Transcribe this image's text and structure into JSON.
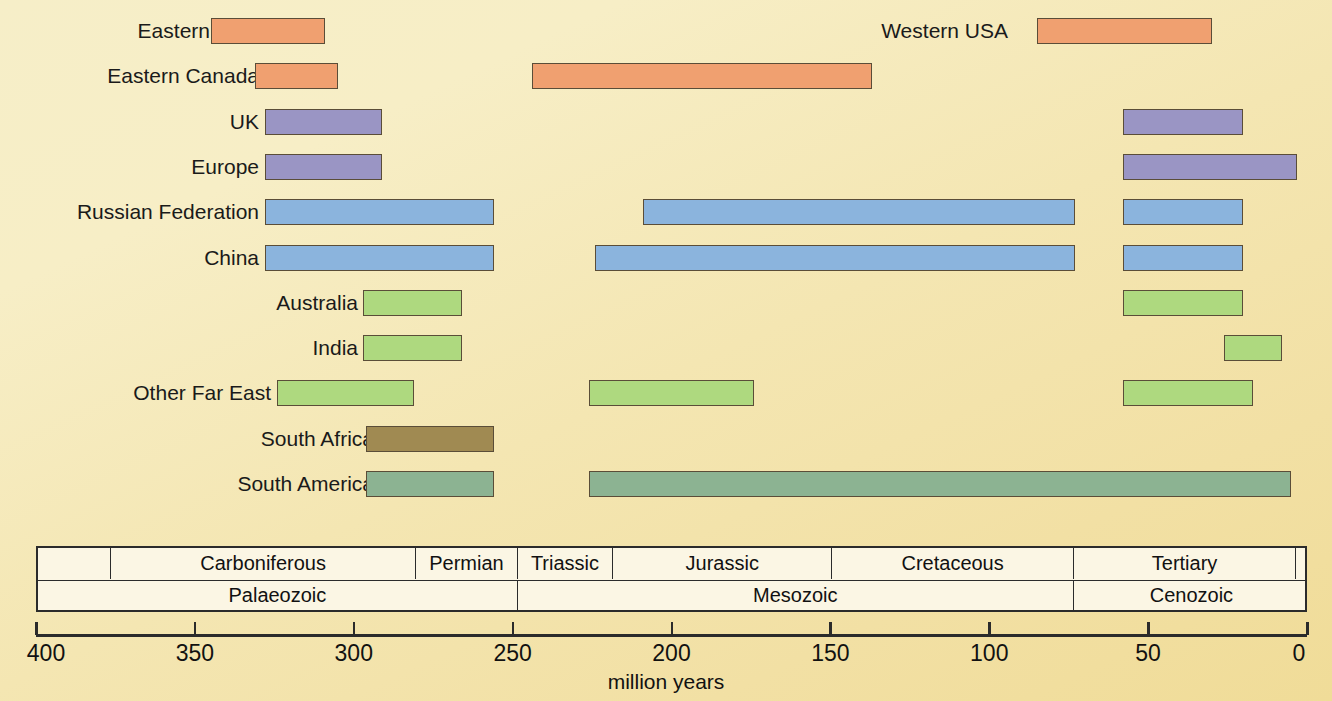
{
  "chart_data": {
    "type": "bar",
    "title": "",
    "subtitle": "",
    "xlabel": "million years",
    "ylabel": "",
    "xlim": [
      400,
      0
    ],
    "x_ticks": [
      400,
      350,
      300,
      250,
      200,
      150,
      100,
      50,
      0
    ],
    "x_tick_labels": [
      "400",
      "350",
      "300",
      "250",
      "200",
      "150",
      "100",
      "50",
      "0"
    ],
    "grid": false,
    "legend": "none",
    "axis_direction": "reversed",
    "note": "Horizontal range (Gantt-style) chart of coal-bearing strata ages by region; each region may have several separate age intervals.",
    "categories": [
      "Eastern USA",
      "Eastern Canada",
      "UK",
      "Europe",
      "Russian Federation",
      "China",
      "Australia",
      "India",
      "Other Far East",
      "South Africa",
      "South America"
    ],
    "series": [
      {
        "name": "Eastern USA",
        "color": "#f0a070",
        "intervals": [
          {
            "from": 345,
            "to": 309
          }
        ]
      },
      {
        "name": "Eastern Canada",
        "color": "#f0a070",
        "intervals": [
          {
            "from": 331,
            "to": 305
          }
        ]
      },
      {
        "name": "UK",
        "color": "#9a95c4",
        "intervals": [
          {
            "from": 328,
            "to": 291
          },
          {
            "from": 58,
            "to": 20
          }
        ]
      },
      {
        "name": "Europe",
        "color": "#9a95c4",
        "intervals": [
          {
            "from": 328,
            "to": 291
          },
          {
            "from": 58,
            "to": 3
          }
        ]
      },
      {
        "name": "Russian Federation",
        "color": "#8bb4dd",
        "intervals": [
          {
            "from": 328,
            "to": 256
          },
          {
            "from": 209,
            "to": 73
          },
          {
            "from": 58,
            "to": 20
          }
        ]
      },
      {
        "name": "China",
        "color": "#8bb4dd",
        "intervals": [
          {
            "from": 328,
            "to": 256
          },
          {
            "from": 224,
            "to": 73
          },
          {
            "from": 58,
            "to": 20
          }
        ]
      },
      {
        "name": "Australia",
        "color": "#aed97f",
        "intervals": [
          {
            "from": 297,
            "to": 266
          },
          {
            "from": 58,
            "to": 20
          }
        ]
      },
      {
        "name": "India",
        "color": "#aed97f",
        "intervals": [
          {
            "from": 297,
            "to": 266
          },
          {
            "from": 26,
            "to": 8
          }
        ]
      },
      {
        "name": "Other Far East",
        "color": "#aed97f",
        "intervals": [
          {
            "from": 324,
            "to": 281
          },
          {
            "from": 226,
            "to": 174
          },
          {
            "from": 58,
            "to": 17
          }
        ]
      },
      {
        "name": "South Africa",
        "color": "#a08a52",
        "intervals": [
          {
            "from": 296,
            "to": 256
          }
        ]
      },
      {
        "name": "South America",
        "color": "#8cb392",
        "intervals": [
          {
            "from": 296,
            "to": 256
          },
          {
            "from": 226,
            "to": 5
          }
        ]
      }
    ],
    "timescale": {
      "periods": [
        {
          "label": "",
          "from": 400,
          "to": 377
        },
        {
          "label": "Carboniferous",
          "from": 377,
          "to": 281
        },
        {
          "label": "Permian",
          "from": 281,
          "to": 249
        },
        {
          "label": "Triassic",
          "from": 249,
          "to": 219
        },
        {
          "label": "Jurassic",
          "from": 219,
          "to": 150
        },
        {
          "label": "Cretaceous",
          "from": 150,
          "to": 74
        },
        {
          "label": "Tertiary",
          "from": 74,
          "to": 4
        },
        {
          "label": "",
          "from": 4,
          "to": 0
        }
      ],
      "eras": [
        {
          "label": "Palaeozoic",
          "from": 400,
          "to": 249
        },
        {
          "label": "Mesozoic",
          "from": 249,
          "to": 74
        },
        {
          "label": "Cenozoic",
          "from": 74,
          "to": 0
        }
      ]
    }
  },
  "colors": {
    "background": "#f5e9b8",
    "orange": "#f0a070",
    "purple": "#9a95c4",
    "blue": "#8bb4dd",
    "green": "#aed97f",
    "brown": "#a08a52",
    "teal_green": "#8cb392",
    "outline": "#5a4d38",
    "axis": "#2b2b2b",
    "scale_fill": "#fbf6e4"
  },
  "label_positions": {
    "Eastern USA": "left",
    "Eastern Canada": "left",
    "UK": "left",
    "Europe": "left",
    "Russian Federation": "left",
    "China": "left",
    "Australia": "left",
    "India": "left",
    "Other Far East": "left",
    "South Africa": "left",
    "South America": "left"
  },
  "extra_labels": [
    {
      "text": "Western USA",
      "row": 0
    },
    {
      "text": "Western Canada",
      "row": 1
    }
  ]
}
